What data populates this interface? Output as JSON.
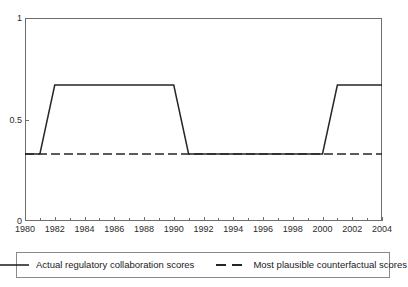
{
  "chart_data": {
    "type": "line",
    "title": "",
    "xlabel": "",
    "ylabel": "",
    "xlim": [
      1980,
      2004
    ],
    "ylim": [
      0,
      1
    ],
    "grid": false,
    "legend_position": "bottom",
    "y_ticks": [
      {
        "value": 1,
        "label": "1"
      },
      {
        "value": 0.5,
        "label": "0.5"
      },
      {
        "value": 0,
        "label": "0"
      }
    ],
    "x_ticks_labeled": [
      {
        "value": 1980,
        "label": "1980"
      },
      {
        "value": 1982,
        "label": "1982"
      },
      {
        "value": 1984,
        "label": "1984"
      },
      {
        "value": 1986,
        "label": "1986"
      },
      {
        "value": 1988,
        "label": "1988"
      },
      {
        "value": 1990,
        "label": "1990"
      },
      {
        "value": 1992,
        "label": "1992"
      },
      {
        "value": 1994,
        "label": "1994"
      },
      {
        "value": 1996,
        "label": "1996"
      },
      {
        "value": 1998,
        "label": "1998"
      },
      {
        "value": 2000,
        "label": "2000"
      },
      {
        "value": 2002,
        "label": "2002"
      },
      {
        "value": 2004,
        "label": "2004"
      }
    ],
    "x": [
      1980,
      1981,
      1982,
      1983,
      1984,
      1985,
      1986,
      1987,
      1988,
      1989,
      1990,
      1991,
      1992,
      1993,
      1994,
      1995,
      1996,
      1997,
      1998,
      1999,
      2000,
      2001,
      2002,
      2003,
      2004
    ],
    "series": [
      {
        "name": "Actual regulatory collaboration scores",
        "style": "solid",
        "color": "#262626",
        "values": [
          0.33,
          0.33,
          0.67,
          0.67,
          0.67,
          0.67,
          0.67,
          0.67,
          0.67,
          0.67,
          0.67,
          0.33,
          0.33,
          0.33,
          0.33,
          0.33,
          0.33,
          0.33,
          0.33,
          0.33,
          0.33,
          0.67,
          0.67,
          0.67,
          0.67
        ]
      },
      {
        "name": "Most plausible counterfactual scores",
        "style": "dashed",
        "color": "#262626",
        "values": [
          0.33,
          0.33,
          0.33,
          0.33,
          0.33,
          0.33,
          0.33,
          0.33,
          0.33,
          0.33,
          0.33,
          0.33,
          0.33,
          0.33,
          0.33,
          0.33,
          0.33,
          0.33,
          0.33,
          0.33,
          0.33,
          0.33,
          0.33,
          0.33,
          0.33
        ]
      }
    ]
  },
  "legend": {
    "entries": [
      {
        "label": "Actual regulatory collaboration scores",
        "style": "solid"
      },
      {
        "label": "Most plausible counterfactual scores",
        "style": "dashed"
      }
    ]
  },
  "colors": {
    "line": "#262626",
    "axis": "#6e6e6e",
    "legend_border": "#8a8a8a",
    "background": "#ffffff",
    "text": "#1a1a1a"
  }
}
